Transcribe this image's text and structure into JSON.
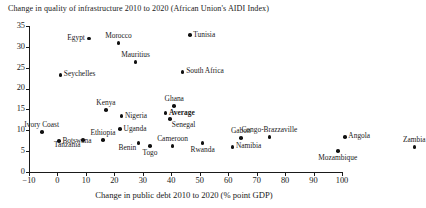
{
  "chart_data": {
    "type": "scatter",
    "title": "Change in quality of infrastructure 2010 to 2020 (African Union's AIDI Index)",
    "xlabel": "Change in public debt 2010 to 2020 (% point GDP)",
    "ylabel": "",
    "xlim": [
      -10,
      100
    ],
    "ylim": [
      0,
      35
    ],
    "xticks": [
      "−10",
      "0",
      "10",
      "20",
      "30",
      "40",
      "50",
      "60",
      "70",
      "80",
      "90",
      "100"
    ],
    "yticks": [
      "0",
      "5",
      "10",
      "15",
      "20",
      "25",
      "30",
      "35"
    ],
    "grid": false,
    "legend": "none",
    "points": [
      {
        "name": "Egypt",
        "x": 11.0,
        "y": 32.0,
        "label_pos": "left"
      },
      {
        "name": "Morocco",
        "x": 21.5,
        "y": 30.9,
        "label_pos": "above"
      },
      {
        "name": "Tunisia",
        "x": 46.5,
        "y": 32.8,
        "label_pos": "right"
      },
      {
        "name": "Mauritius",
        "x": 27.5,
        "y": 26.4,
        "label_pos": "above"
      },
      {
        "name": "South Africa",
        "x": 44.0,
        "y": 24.0,
        "label_pos": "right"
      },
      {
        "name": "Seychelles",
        "x": 1.0,
        "y": 23.3,
        "label_pos": "right"
      },
      {
        "name": "Ghana",
        "x": 41.0,
        "y": 15.8,
        "label_pos": "above"
      },
      {
        "name": "Average",
        "x": 38.0,
        "y": 14.1,
        "label_pos": "right-bold"
      },
      {
        "name": "Senegal",
        "x": 39.5,
        "y": 12.7,
        "label_pos": "below-right"
      },
      {
        "name": "Kenya",
        "x": 17.0,
        "y": 14.9,
        "label_pos": "above"
      },
      {
        "name": "Nigeria",
        "x": 22.5,
        "y": 13.4,
        "label_pos": "right"
      },
      {
        "name": "Ivory Coast",
        "x": -5.5,
        "y": 9.6,
        "label_pos": "above"
      },
      {
        "name": "Ethiopia",
        "x": 16.0,
        "y": 7.6,
        "label_pos": "above"
      },
      {
        "name": "Uganda",
        "x": 22.0,
        "y": 10.3,
        "label_pos": "right"
      },
      {
        "name": "Botswana",
        "x": 0.5,
        "y": 7.4,
        "label_pos": "right"
      },
      {
        "name": "Tanzania",
        "x": 9.0,
        "y": 7.7,
        "label_pos": "below-left"
      },
      {
        "name": "Benin",
        "x": 28.5,
        "y": 7.0,
        "label_pos": "below-left"
      },
      {
        "name": "Togo",
        "x": 32.5,
        "y": 6.2,
        "label_pos": "below"
      },
      {
        "name": "Cameroon",
        "x": 40.5,
        "y": 6.2,
        "label_pos": "above"
      },
      {
        "name": "Rwanda",
        "x": 51.0,
        "y": 6.9,
        "label_pos": "below"
      },
      {
        "name": "Gabon",
        "x": 64.5,
        "y": 8.1,
        "label_pos": "above"
      },
      {
        "name": "Congo-Brazzaville",
        "x": 74.5,
        "y": 8.4,
        "label_pos": "above"
      },
      {
        "name": "Namibia",
        "x": 61.5,
        "y": 6.0,
        "label_pos": "right"
      },
      {
        "name": "Angola",
        "x": 101.0,
        "y": 8.4,
        "label_pos": "right"
      },
      {
        "name": "Mozambique",
        "x": 98.5,
        "y": 5.0,
        "label_pos": "below"
      },
      {
        "name": "Zambia",
        "x": 125.5,
        "y": 6.0,
        "label_pos": "above"
      }
    ]
  }
}
